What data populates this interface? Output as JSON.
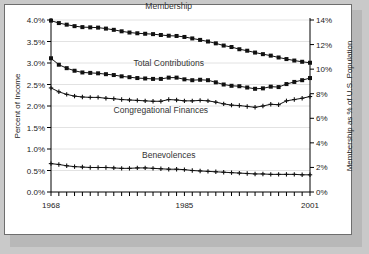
{
  "chart_data": {
    "type": "line",
    "title": "",
    "xlabel": "",
    "ylabel": "Percent of Income",
    "y2label": "Membership as % of U.S. Population",
    "xlim": [
      1968,
      2001
    ],
    "ylim": [
      0.0,
      4.0
    ],
    "y2lim": [
      0,
      14
    ],
    "grid": true,
    "legend_position": "inline-annotations",
    "x": [
      1968,
      1969,
      1970,
      1971,
      1972,
      1973,
      1974,
      1975,
      1976,
      1977,
      1978,
      1979,
      1980,
      1981,
      1982,
      1983,
      1984,
      1985,
      1986,
      1987,
      1988,
      1989,
      1990,
      1991,
      1992,
      1993,
      1994,
      1995,
      1996,
      1997,
      1998,
      1999,
      2000,
      2001
    ],
    "x_tick_labels": [
      "1968",
      "1985",
      "2001"
    ],
    "x_tick_values": [
      1968,
      1985,
      2001
    ],
    "y_tick_labels": [
      "0.0%",
      "0.5%",
      "1.0%",
      "1.5%",
      "2.0%",
      "2.5%",
      "3.0%",
      "3.5%",
      "4.0%"
    ],
    "y_tick_values": [
      0.0,
      0.5,
      1.0,
      1.5,
      2.0,
      2.5,
      3.0,
      3.5,
      4.0
    ],
    "y2_tick_labels": [
      "0%",
      "2%",
      "4%",
      "6%",
      "8%",
      "10%",
      "12%",
      "14%"
    ],
    "y2_tick_values": [
      0,
      2,
      4,
      6,
      8,
      10,
      12,
      14
    ],
    "series": [
      {
        "name": "Membership",
        "axis": "right",
        "marker": "square",
        "label_x": 1983,
        "label_y2": 14.9,
        "values": [
          13.95,
          13.75,
          13.62,
          13.5,
          13.42,
          13.4,
          13.38,
          13.3,
          13.2,
          13.08,
          12.98,
          12.92,
          12.88,
          12.85,
          12.78,
          12.72,
          12.7,
          12.62,
          12.5,
          12.38,
          12.25,
          12.1,
          11.92,
          11.8,
          11.62,
          11.5,
          11.35,
          11.22,
          11.1,
          10.95,
          10.82,
          10.7,
          10.6,
          10.52
        ]
      },
      {
        "name": "Total Contributions",
        "axis": "left",
        "marker": "square",
        "label_x": 1983,
        "label_y": 2.92,
        "values": [
          3.11,
          2.96,
          2.88,
          2.82,
          2.78,
          2.77,
          2.76,
          2.74,
          2.72,
          2.69,
          2.67,
          2.65,
          2.64,
          2.63,
          2.63,
          2.66,
          2.66,
          2.62,
          2.6,
          2.61,
          2.6,
          2.55,
          2.5,
          2.47,
          2.46,
          2.43,
          2.4,
          2.41,
          2.45,
          2.44,
          2.51,
          2.56,
          2.6,
          2.65
        ]
      },
      {
        "name": "Congregational Finances",
        "axis": "left",
        "marker": "plus",
        "label_x": 1982,
        "label_y": 1.84,
        "values": [
          2.42,
          2.33,
          2.27,
          2.23,
          2.21,
          2.2,
          2.2,
          2.18,
          2.17,
          2.15,
          2.14,
          2.13,
          2.12,
          2.11,
          2.11,
          2.15,
          2.14,
          2.12,
          2.12,
          2.13,
          2.12,
          2.09,
          2.05,
          2.02,
          2.01,
          1.99,
          1.97,
          2.0,
          2.04,
          2.03,
          2.12,
          2.15,
          2.18,
          2.22
        ]
      },
      {
        "name": "Benevolences",
        "axis": "left",
        "marker": "plus",
        "label_x": 1983,
        "label_y": 0.8,
        "values": [
          0.66,
          0.64,
          0.61,
          0.59,
          0.58,
          0.57,
          0.57,
          0.57,
          0.56,
          0.55,
          0.55,
          0.56,
          0.56,
          0.55,
          0.54,
          0.53,
          0.53,
          0.52,
          0.5,
          0.49,
          0.48,
          0.47,
          0.46,
          0.45,
          0.44,
          0.43,
          0.42,
          0.42,
          0.41,
          0.41,
          0.41,
          0.41,
          0.4,
          0.4
        ]
      }
    ]
  },
  "axes": {
    "left_title": "Percent of Income",
    "right_title": "Membership as % of U.S. Population"
  }
}
